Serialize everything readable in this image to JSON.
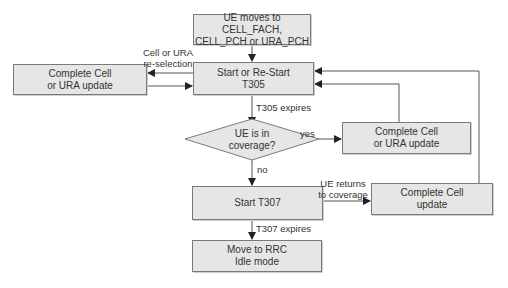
{
  "nodes": {
    "entry": {
      "label": "UE moves to CELL_FACH,\nCELL_PCH or URA_PCH"
    },
    "start_t305": {
      "label": "Start or Re-Start\nT305"
    },
    "left_update": {
      "label": "Complete Cell\nor URA update"
    },
    "decision": {
      "label": "UE is in\ncoverage?"
    },
    "right_update": {
      "label": "Complete Cell\nor URA update"
    },
    "start_t307": {
      "label": "Start T307"
    },
    "cell_update": {
      "label": "Complete Cell\nupdate"
    },
    "idle": {
      "label": "Move to RRC\nIdle mode"
    }
  },
  "edges": {
    "reselection": "Cell or URA\nre-selection",
    "t305_expires": "T305 expires",
    "yes": "yes",
    "no": "no",
    "returns": "UE returns\nto coverage",
    "t307_expires": "T307 expires"
  },
  "colors": {
    "box_fill": "#e6e6e6",
    "border": "#7a7a7a",
    "line": "#555555"
  }
}
